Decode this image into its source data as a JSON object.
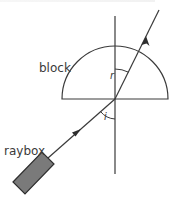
{
  "diagram": {
    "type": "refraction-through-semicircular-block",
    "labels": {
      "block": "block",
      "raybox": "raybox",
      "refraction_angle": "r",
      "incidence_angle": "i"
    },
    "colors": {
      "line": "#3a3a3a",
      "raybox_fill": "#7a7a7a",
      "raybox_stroke": "#2e2e2e",
      "background": "#ffffff"
    },
    "geometry": {
      "normal": {
        "x": 115,
        "y1": 16,
        "y2": 174
      },
      "block": {
        "center_x": 115,
        "flat_y": 99,
        "radius": 53
      },
      "incident_ray": {
        "from": [
          48,
          158
        ],
        "to": [
          115,
          99
        ]
      },
      "refracted_ray": {
        "from": [
          115,
          99
        ],
        "to": [
          159,
          10
        ]
      },
      "raybox_corners": [
        [
          13,
          182
        ],
        [
          42,
          152
        ],
        [
          54,
          164
        ],
        [
          25,
          194
        ]
      ]
    }
  }
}
